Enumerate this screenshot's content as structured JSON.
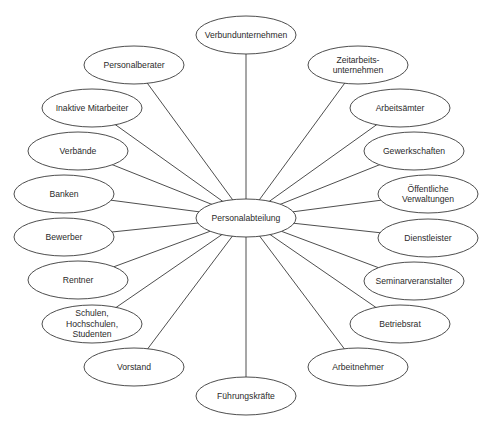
{
  "diagram": {
    "type": "hub-and-spoke",
    "colors": {
      "stroke": "#3a3a3a",
      "fill": "#ffffff",
      "text": "#2a2a2a"
    },
    "center": {
      "id": "personalabteilung",
      "lines": [
        "Personalabteilung"
      ],
      "cx": 246,
      "cy": 218,
      "rx": 50,
      "ry": 19
    },
    "nodes": [
      {
        "id": "verbundunternehmen",
        "lines": [
          "Verbundunternehmen"
        ],
        "cx": 246,
        "cy": 35,
        "rx": 50,
        "ry": 19
      },
      {
        "id": "zeitarbeitsunternehmen",
        "lines": [
          "Zeitarbeits-",
          "unternehmen"
        ],
        "cx": 358,
        "cy": 65,
        "rx": 50,
        "ry": 19
      },
      {
        "id": "arbeitsaemter",
        "lines": [
          "Arbeitsämter"
        ],
        "cx": 400,
        "cy": 108,
        "rx": 50,
        "ry": 19
      },
      {
        "id": "gewerkschaften",
        "lines": [
          "Gewerkschaften"
        ],
        "cx": 414,
        "cy": 151,
        "rx": 50,
        "ry": 19
      },
      {
        "id": "oeffentliche-verwaltungen",
        "lines": [
          "Öffentliche",
          "Verwaltungen"
        ],
        "cx": 428,
        "cy": 194,
        "rx": 50,
        "ry": 19
      },
      {
        "id": "dienstleister",
        "lines": [
          "Dienstleister"
        ],
        "cx": 428,
        "cy": 238,
        "rx": 50,
        "ry": 19
      },
      {
        "id": "seminarveranstalter",
        "lines": [
          "Seminarveranstalter"
        ],
        "cx": 414,
        "cy": 281,
        "rx": 50,
        "ry": 19
      },
      {
        "id": "betriebsrat",
        "lines": [
          "Betriebsrat"
        ],
        "cx": 400,
        "cy": 324,
        "rx": 50,
        "ry": 19
      },
      {
        "id": "arbeitnehmer",
        "lines": [
          "Arbeitnehmer"
        ],
        "cx": 358,
        "cy": 367,
        "rx": 50,
        "ry": 19
      },
      {
        "id": "fuehrungskraefte",
        "lines": [
          "Führungskräfte"
        ],
        "cx": 246,
        "cy": 396,
        "rx": 50,
        "ry": 19
      },
      {
        "id": "vorstand",
        "lines": [
          "Vorstand"
        ],
        "cx": 134,
        "cy": 367,
        "rx": 50,
        "ry": 19
      },
      {
        "id": "schulen",
        "lines": [
          "Schulen,",
          "Hochschulen,",
          "Studenten"
        ],
        "cx": 92,
        "cy": 324,
        "rx": 50,
        "ry": 19
      },
      {
        "id": "rentner",
        "lines": [
          "Rentner"
        ],
        "cx": 78,
        "cy": 280,
        "rx": 50,
        "ry": 19
      },
      {
        "id": "bewerber",
        "lines": [
          "Bewerber"
        ],
        "cx": 64,
        "cy": 237,
        "rx": 50,
        "ry": 19
      },
      {
        "id": "banken",
        "lines": [
          "Banken"
        ],
        "cx": 64,
        "cy": 194,
        "rx": 50,
        "ry": 19
      },
      {
        "id": "verbaende",
        "lines": [
          "Verbände"
        ],
        "cx": 78,
        "cy": 151,
        "rx": 50,
        "ry": 19
      },
      {
        "id": "inaktive-mitarbeiter",
        "lines": [
          "Inaktive Mitarbeiter"
        ],
        "cx": 92,
        "cy": 108,
        "rx": 50,
        "ry": 19
      },
      {
        "id": "personalberater",
        "lines": [
          "Personalberater"
        ],
        "cx": 134,
        "cy": 65,
        "rx": 50,
        "ry": 19
      }
    ]
  }
}
